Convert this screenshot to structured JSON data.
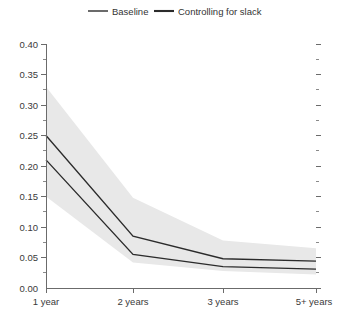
{
  "chart_data": {
    "type": "line",
    "title": "",
    "subtitle": "",
    "xlabel": "",
    "ylabel": "",
    "categories": [
      "1 year",
      "2 years",
      "3 years",
      "5+ years"
    ],
    "series": [
      {
        "name": "Baseline",
        "values": [
          0.25,
          0.085,
          0.048,
          0.044
        ],
        "confidence_band_upper": [
          0.33,
          0.148,
          0.078,
          0.065
        ],
        "confidence_band_lower": [
          0.15,
          0.042,
          0.028,
          0.022
        ]
      },
      {
        "name": "Controlling for slack",
        "values": [
          0.21,
          0.055,
          0.035,
          0.031
        ]
      }
    ],
    "ylim": [
      0.0,
      0.4
    ],
    "xlim": [
      0,
      3
    ],
    "y_ticks": [
      "0.00",
      "0.05",
      "0.10",
      "0.15",
      "0.20",
      "0.25",
      "0.30",
      "0.35",
      "0.40"
    ],
    "y_tick_values": [
      0.0,
      0.05,
      0.1,
      0.15,
      0.2,
      0.25,
      0.3,
      0.35,
      0.4
    ],
    "y_minor_tick_values": [
      0.025,
      0.075,
      0.125,
      0.175,
      0.225,
      0.275,
      0.325,
      0.375
    ],
    "grid": false,
    "legend_position": "top-center",
    "band_color": "#e8e8e8",
    "line_color": "#2b2b2b",
    "axis_color": "#6b6b6b",
    "background": "#ffffff"
  },
  "legend": {
    "items": [
      {
        "label": "Baseline"
      },
      {
        "label": "Controlling for slack"
      }
    ]
  },
  "y_axis": {
    "labels": [
      "0.40",
      "0.35",
      "0.30",
      "0.25",
      "0.20",
      "0.15",
      "0.10",
      "0.05",
      "0.00"
    ]
  },
  "x_axis": {
    "labels": [
      "1 year",
      "2 years",
      "3 years",
      "5+ years"
    ]
  }
}
